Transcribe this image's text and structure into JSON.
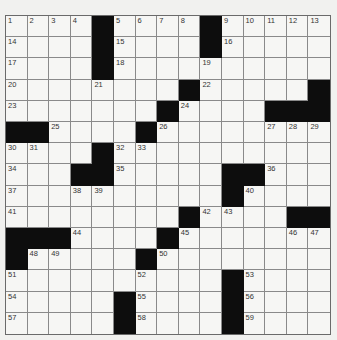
{
  "puzzle": {
    "rows": 15,
    "cols": 15,
    "colors": {
      "black": "#0d0d0d",
      "cell": "#f6f6f4",
      "background": "#f1f1ef"
    },
    "layout": [
      "....#....#.....",
      "....#....#.....",
      "....#..........",
      "........#.....#",
      ".......#....###",
      "##....#........",
      "....#..........",
      "...##.....##...",
      "..........#....",
      "........#....##",
      "###....#.......",
      "#.....#........",
      "..........#....",
      ".....#....#....",
      ".....#....#...."
    ],
    "numbers": [
      {
        "r": 0,
        "c": 0,
        "n": "1"
      },
      {
        "r": 0,
        "c": 1,
        "n": "2"
      },
      {
        "r": 0,
        "c": 2,
        "n": "3"
      },
      {
        "r": 0,
        "c": 3,
        "n": "4"
      },
      {
        "r": 0,
        "c": 5,
        "n": "5"
      },
      {
        "r": 0,
        "c": 6,
        "n": "6"
      },
      {
        "r": 0,
        "c": 7,
        "n": "7"
      },
      {
        "r": 0,
        "c": 8,
        "n": "8"
      },
      {
        "r": 0,
        "c": 10,
        "n": "9"
      },
      {
        "r": 0,
        "c": 11,
        "n": "10"
      },
      {
        "r": 0,
        "c": 12,
        "n": "11"
      },
      {
        "r": 0,
        "c": 13,
        "n": "12"
      },
      {
        "r": 0,
        "c": 14,
        "n": "13"
      },
      {
        "r": 1,
        "c": 0,
        "n": "14"
      },
      {
        "r": 1,
        "c": 5,
        "n": "15"
      },
      {
        "r": 1,
        "c": 10,
        "n": "16"
      },
      {
        "r": 2,
        "c": 0,
        "n": "17"
      },
      {
        "r": 2,
        "c": 5,
        "n": "18"
      },
      {
        "r": 2,
        "c": 9,
        "n": "19"
      },
      {
        "r": 3,
        "c": 0,
        "n": "20"
      },
      {
        "r": 3,
        "c": 4,
        "n": "21"
      },
      {
        "r": 3,
        "c": 9,
        "n": "22"
      },
      {
        "r": 4,
        "c": 0,
        "n": "23"
      },
      {
        "r": 4,
        "c": 8,
        "n": "24"
      },
      {
        "r": 5,
        "c": 2,
        "n": "25"
      },
      {
        "r": 5,
        "c": 7,
        "n": "26"
      },
      {
        "r": 5,
        "c": 12,
        "n": "27"
      },
      {
        "r": 5,
        "c": 13,
        "n": "28"
      },
      {
        "r": 5,
        "c": 14,
        "n": "29"
      },
      {
        "r": 6,
        "c": 0,
        "n": "30"
      },
      {
        "r": 6,
        "c": 1,
        "n": "31"
      },
      {
        "r": 6,
        "c": 5,
        "n": "32"
      },
      {
        "r": 6,
        "c": 6,
        "n": "33"
      },
      {
        "r": 7,
        "c": 0,
        "n": "34"
      },
      {
        "r": 7,
        "c": 5,
        "n": "35"
      },
      {
        "r": 7,
        "c": 12,
        "n": "36"
      },
      {
        "r": 8,
        "c": 0,
        "n": "37"
      },
      {
        "r": 8,
        "c": 3,
        "n": "38"
      },
      {
        "r": 8,
        "c": 4,
        "n": "39"
      },
      {
        "r": 8,
        "c": 11,
        "n": "40"
      },
      {
        "r": 9,
        "c": 0,
        "n": "41"
      },
      {
        "r": 9,
        "c": 9,
        "n": "42"
      },
      {
        "r": 9,
        "c": 10,
        "n": "43"
      },
      {
        "r": 10,
        "c": 3,
        "n": "44"
      },
      {
        "r": 10,
        "c": 8,
        "n": "45"
      },
      {
        "r": 10,
        "c": 13,
        "n": "46"
      },
      {
        "r": 10,
        "c": 14,
        "n": "47"
      },
      {
        "r": 11,
        "c": 1,
        "n": "48"
      },
      {
        "r": 11,
        "c": 2,
        "n": "49"
      },
      {
        "r": 11,
        "c": 7,
        "n": "50"
      },
      {
        "r": 12,
        "c": 0,
        "n": "51"
      },
      {
        "r": 12,
        "c": 6,
        "n": "52"
      },
      {
        "r": 12,
        "c": 11,
        "n": "53"
      },
      {
        "r": 13,
        "c": 0,
        "n": "54"
      },
      {
        "r": 13,
        "c": 6,
        "n": "55"
      },
      {
        "r": 13,
        "c": 11,
        "n": "56"
      },
      {
        "r": 14,
        "c": 0,
        "n": "57"
      },
      {
        "r": 14,
        "c": 6,
        "n": "58"
      },
      {
        "r": 14,
        "c": 11,
        "n": "59"
      }
    ]
  }
}
